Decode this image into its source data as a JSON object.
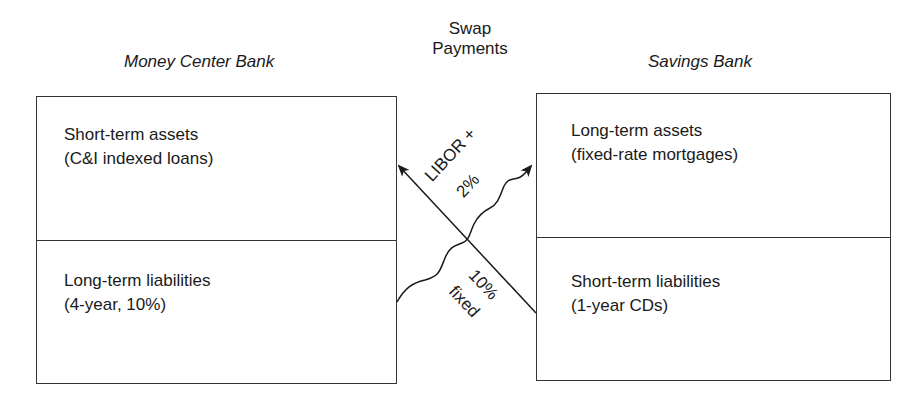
{
  "diagram": {
    "center_label": {
      "line1": "Swap",
      "line2": "Payments"
    },
    "left_bank": {
      "title": "Money Center Bank",
      "assets": {
        "line1": "Short-term assets",
        "line2": "(C&I indexed loans)"
      },
      "liabilities": {
        "line1": "Long-term liabilities",
        "line2": "(4-year, 10%)"
      }
    },
    "right_bank": {
      "title": "Savings Bank",
      "assets": {
        "line1": "Long-term assets",
        "line2": "(fixed-rate mortgages)"
      },
      "liabilities": {
        "line1": "Short-term liabilities",
        "line2": "(1-year CDs)"
      }
    },
    "flows": {
      "floating_payment": {
        "line1": "LIBOR +",
        "line2": "2%",
        "direction": "Savings Bank liabilities → Money Center Bank assets"
      },
      "fixed_payment": {
        "line1": "10%",
        "line2": "fixed",
        "direction": "Money Center Bank liabilities → Savings Bank assets"
      }
    },
    "colors": {
      "line": "#1a1a1a",
      "border": "#333333",
      "background": "#ffffff"
    }
  }
}
